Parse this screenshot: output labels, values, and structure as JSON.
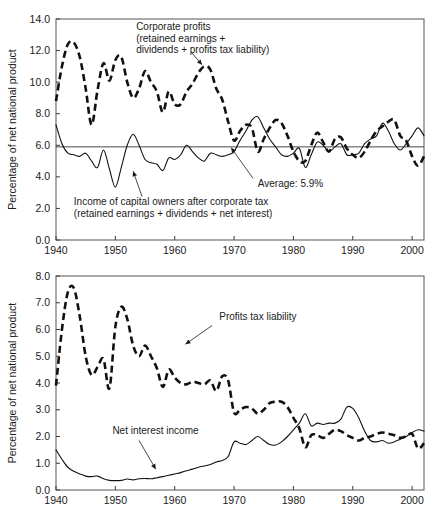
{
  "figure": {
    "title": "",
    "panels": [
      "top",
      "bottom"
    ]
  },
  "chart_data": [
    {
      "id": "top",
      "type": "line",
      "title": "",
      "xlabel": "",
      "ylabel": "Percentage of net national product",
      "xlim": [
        1940,
        2002
      ],
      "ylim": [
        0.0,
        14.0
      ],
      "grid": false,
      "legend_position": "inline-annotations",
      "xticks": [
        "1940",
        "1950",
        "1960",
        "1970",
        "1980",
        "1990",
        "2000"
      ],
      "xtick_values": [
        1940,
        1950,
        1960,
        1970,
        1980,
        1990,
        2000
      ],
      "yticks": [
        "0.0",
        "2.0",
        "4.0",
        "6.0",
        "8.0",
        "10.0",
        "12.0",
        "14.0"
      ],
      "ytick_values": [
        0.0,
        2.0,
        4.0,
        6.0,
        8.0,
        10.0,
        12.0,
        14.0
      ],
      "annotations": [
        {
          "name": "corporate-profits-label",
          "lines": [
            "Corporate profits",
            "(retained earnings +",
            "dividends + profits tax liability)"
          ],
          "x": 1953.5,
          "y": 13.3,
          "leader_from": [
            1962.8,
            11.9
          ],
          "leader_to": [
            1964.6,
            11.1
          ]
        },
        {
          "name": "average-label",
          "lines": [
            "Average: 5.9%"
          ],
          "x": 1974.0,
          "y": 3.35,
          "leader_from": [
            1973.2,
            3.9
          ],
          "leader_to": [
            1969.5,
            5.85
          ]
        },
        {
          "name": "income-capital-owners-label",
          "lines": [
            "Income of capital owners after corporate tax",
            "(retained earnings + dividends + net interest)"
          ],
          "x": 1943.0,
          "y": 2.2,
          "leader_from": [
            1954.5,
            2.75
          ],
          "leader_to": [
            1953.0,
            4.35
          ]
        }
      ],
      "reference_line": {
        "name": "average",
        "label": "Average: 5.9%",
        "value": 5.9
      },
      "series": [
        {
          "name": "Corporate profits (retained earnings + dividends + profits tax liability)",
          "style": "dashed",
          "x": [
            1940,
            1941,
            1942,
            1943,
            1944,
            1945,
            1946,
            1947,
            1948,
            1949,
            1950,
            1951,
            1952,
            1953,
            1954,
            1955,
            1956,
            1957,
            1958,
            1959,
            1960,
            1961,
            1962,
            1963,
            1964,
            1965,
            1966,
            1967,
            1968,
            1969,
            1970,
            1971,
            1972,
            1973,
            1974,
            1975,
            1976,
            1977,
            1978,
            1979,
            1980,
            1981,
            1982,
            1983,
            1984,
            1985,
            1986,
            1987,
            1988,
            1989,
            1990,
            1991,
            1992,
            1993,
            1994,
            1995,
            1996,
            1997,
            1998,
            1999,
            2000,
            2001,
            2002
          ],
          "values": [
            8.8,
            11.0,
            12.4,
            12.5,
            11.6,
            9.6,
            7.3,
            9.5,
            11.2,
            10.1,
            11.4,
            11.6,
            10.0,
            9.0,
            9.6,
            10.7,
            10.0,
            9.4,
            8.1,
            9.4,
            8.6,
            8.6,
            9.4,
            9.9,
            10.6,
            11.0,
            10.8,
            9.6,
            8.9,
            7.5,
            6.3,
            6.9,
            7.3,
            7.1,
            5.6,
            6.4,
            7.1,
            7.6,
            7.4,
            6.6,
            5.6,
            5.0,
            5.0,
            6.0,
            6.8,
            6.2,
            5.6,
            6.4,
            6.5,
            5.8,
            5.4,
            5.2,
            5.6,
            6.3,
            6.9,
            7.2,
            7.5,
            7.6,
            6.6,
            6.3,
            5.3,
            4.7,
            5.3
          ]
        },
        {
          "name": "Income of capital owners after corporate tax (retained earnings + dividends + net interest)",
          "style": "solid",
          "x": [
            1940,
            1941,
            1942,
            1943,
            1944,
            1945,
            1946,
            1947,
            1948,
            1949,
            1950,
            1951,
            1952,
            1953,
            1954,
            1955,
            1956,
            1957,
            1958,
            1959,
            1960,
            1961,
            1962,
            1963,
            1964,
            1965,
            1966,
            1967,
            1968,
            1969,
            1970,
            1971,
            1972,
            1973,
            1974,
            1975,
            1976,
            1977,
            1978,
            1979,
            1980,
            1981,
            1982,
            1983,
            1984,
            1985,
            1986,
            1987,
            1988,
            1989,
            1990,
            1991,
            1992,
            1993,
            1994,
            1995,
            1996,
            1997,
            1998,
            1999,
            2000,
            2001,
            2002
          ],
          "values": [
            7.3,
            6.1,
            5.5,
            5.4,
            5.3,
            5.5,
            5.0,
            4.6,
            5.7,
            4.5,
            3.35,
            4.6,
            6.0,
            6.7,
            6.0,
            5.1,
            4.9,
            4.8,
            4.4,
            5.2,
            5.1,
            5.4,
            6.0,
            5.6,
            5.2,
            5.0,
            5.5,
            5.4,
            5.3,
            5.4,
            5.6,
            6.3,
            6.9,
            7.6,
            7.8,
            7.1,
            6.4,
            5.9,
            5.4,
            5.3,
            5.5,
            5.8,
            4.6,
            5.4,
            6.2,
            6.0,
            5.6,
            5.9,
            6.1,
            5.4,
            5.4,
            5.5,
            6.1,
            6.4,
            6.6,
            7.4,
            6.9,
            6.1,
            5.7,
            6.1,
            6.6,
            7.1,
            6.6,
            5.6,
            5.9
          ]
        }
      ]
    },
    {
      "id": "bottom",
      "type": "line",
      "title": "",
      "xlabel": "",
      "ylabel": "Percentage of net national product",
      "xlim": [
        1940,
        2002
      ],
      "ylim": [
        0.0,
        8.0
      ],
      "grid": false,
      "legend_position": "inline-annotations",
      "xticks": [
        "1940",
        "1950",
        "1960",
        "1970",
        "1980",
        "1990",
        "2000"
      ],
      "xtick_values": [
        1940,
        1950,
        1960,
        1970,
        1980,
        1990,
        2000
      ],
      "yticks": [
        "0.0",
        "1.0",
        "2.0",
        "3.0",
        "4.0",
        "5.0",
        "6.0",
        "7.0",
        "8.0"
      ],
      "ytick_values": [
        0.0,
        1.0,
        2.0,
        3.0,
        4.0,
        5.0,
        6.0,
        7.0,
        8.0
      ],
      "annotations": [
        {
          "name": "profits-tax-liability-label",
          "lines": [
            "Profits tax liability"
          ],
          "x": 1967.5,
          "y": 6.35,
          "leader_from": [
            1966.3,
            6.15
          ],
          "leader_to": [
            1961.8,
            5.45
          ]
        },
        {
          "name": "net-interest-income-label",
          "lines": [
            "Net interest income"
          ],
          "x": 1949.5,
          "y": 2.1,
          "leader_from": [
            1954.0,
            1.85
          ],
          "leader_to": [
            1956.8,
            0.78
          ]
        }
      ],
      "series": [
        {
          "name": "Profits tax liability",
          "style": "dashed",
          "x": [
            1940,
            1941,
            1942,
            1943,
            1944,
            1945,
            1946,
            1947,
            1948,
            1949,
            1950,
            1951,
            1952,
            1953,
            1954,
            1955,
            1956,
            1957,
            1958,
            1959,
            1960,
            1961,
            1962,
            1963,
            1964,
            1965,
            1966,
            1967,
            1968,
            1969,
            1970,
            1971,
            1972,
            1973,
            1974,
            1975,
            1976,
            1977,
            1978,
            1979,
            1980,
            1981,
            1982,
            1983,
            1984,
            1985,
            1986,
            1987,
            1988,
            1989,
            1990,
            1991,
            1992,
            1993,
            1994,
            1995,
            1996,
            1997,
            1998,
            1999,
            2000,
            2001,
            2002
          ],
          "values": [
            3.9,
            6.0,
            7.4,
            7.55,
            6.5,
            5.0,
            4.3,
            4.6,
            4.9,
            3.8,
            6.1,
            6.85,
            6.4,
            5.4,
            5.0,
            5.4,
            5.0,
            4.55,
            3.85,
            4.5,
            4.2,
            4.0,
            3.95,
            4.05,
            4.0,
            3.95,
            4.1,
            3.7,
            4.25,
            4.1,
            2.9,
            3.0,
            3.1,
            3.05,
            2.85,
            3.0,
            3.25,
            3.3,
            3.3,
            3.1,
            2.7,
            2.3,
            1.6,
            2.05,
            2.05,
            1.95,
            2.1,
            2.25,
            2.2,
            2.05,
            1.95,
            1.85,
            1.95,
            2.0,
            2.1,
            2.15,
            2.1,
            2.05,
            1.95,
            2.0,
            2.1,
            1.55,
            1.75
          ]
        },
        {
          "name": "Net interest income",
          "style": "solid",
          "x": [
            1940,
            1941,
            1942,
            1943,
            1944,
            1945,
            1946,
            1947,
            1948,
            1949,
            1950,
            1951,
            1952,
            1953,
            1954,
            1955,
            1956,
            1957,
            1958,
            1959,
            1960,
            1961,
            1962,
            1963,
            1964,
            1965,
            1966,
            1967,
            1968,
            1969,
            1970,
            1971,
            1972,
            1973,
            1974,
            1975,
            1976,
            1977,
            1978,
            1979,
            1980,
            1981,
            1982,
            1983,
            1984,
            1985,
            1986,
            1987,
            1988,
            1989,
            1990,
            1991,
            1992,
            1993,
            1994,
            1995,
            1996,
            1997,
            1998,
            1999,
            2000,
            2001,
            2002
          ],
          "values": [
            1.5,
            1.15,
            0.85,
            0.7,
            0.6,
            0.52,
            0.5,
            0.52,
            0.42,
            0.36,
            0.35,
            0.36,
            0.41,
            0.38,
            0.42,
            0.43,
            0.42,
            0.46,
            0.5,
            0.55,
            0.6,
            0.65,
            0.72,
            0.78,
            0.85,
            0.9,
            0.95,
            1.05,
            1.1,
            1.25,
            1.8,
            1.75,
            1.7,
            1.85,
            2.0,
            1.85,
            1.7,
            1.68,
            1.8,
            2.0,
            2.25,
            2.5,
            2.85,
            2.4,
            2.5,
            2.45,
            2.5,
            2.5,
            2.65,
            3.1,
            3.05,
            2.7,
            2.2,
            1.85,
            1.8,
            1.85,
            1.75,
            1.8,
            1.9,
            2.0,
            2.15,
            2.25,
            2.2
          ]
        }
      ]
    }
  ]
}
